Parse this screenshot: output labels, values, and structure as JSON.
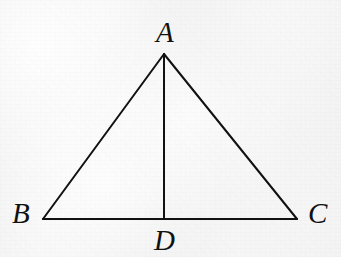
{
  "figure": {
    "name": "isosceles-triangle-with-altitude",
    "width": 341,
    "height": 257,
    "background_color": "#f4f4f4",
    "stroke_color": "#111111",
    "stroke_width": 2,
    "vertices": {
      "A": {
        "label": "A",
        "x": 164,
        "y": 54
      },
      "B": {
        "label": "B",
        "x": 43,
        "y": 219
      },
      "C": {
        "label": "C",
        "x": 297,
        "y": 219
      },
      "D": {
        "label": "D",
        "x": 164,
        "y": 219
      }
    },
    "segments": [
      {
        "name": "side-AB",
        "from": "A",
        "to": "B"
      },
      {
        "name": "side-AC",
        "from": "A",
        "to": "C"
      },
      {
        "name": "base-BC",
        "from": "B",
        "to": "C"
      },
      {
        "name": "altitude-AD",
        "from": "A",
        "to": "D"
      }
    ],
    "labels": {
      "A": "A",
      "B": "B",
      "C": "C",
      "D": "D"
    }
  }
}
